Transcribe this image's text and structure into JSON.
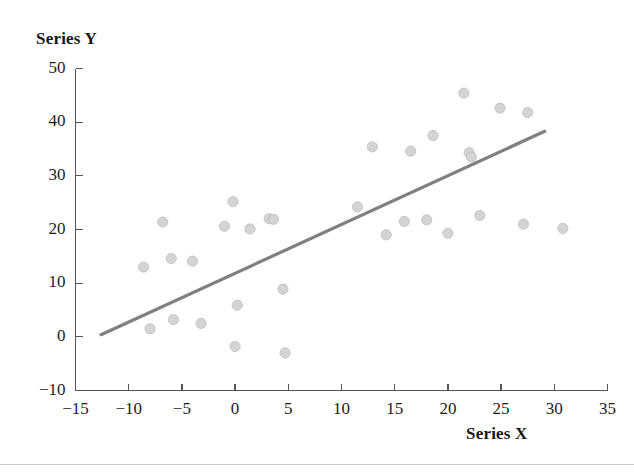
{
  "chart_data": {
    "type": "scatter",
    "title": "",
    "xlabel": "Series X",
    "ylabel": "Series Y",
    "xlim": [
      -15,
      35
    ],
    "ylim": [
      -10,
      50
    ],
    "xticks": [
      -15,
      -10,
      -5,
      0,
      5,
      10,
      15,
      20,
      25,
      30,
      35
    ],
    "yticks": [
      -10,
      0,
      10,
      20,
      30,
      40,
      50
    ],
    "grid": false,
    "legend": null,
    "marker_color": "#d4d4d4",
    "marker_edge_color": "#bdbdbd",
    "trendline_color": "#808080",
    "axis_color": "#555555",
    "series": [
      {
        "name": "Series Y",
        "marker": "circle",
        "points": [
          {
            "x": -8.6,
            "y": 13.0
          },
          {
            "x": -8.0,
            "y": 1.5
          },
          {
            "x": -6.8,
            "y": 21.4
          },
          {
            "x": -6.0,
            "y": 14.6
          },
          {
            "x": -5.8,
            "y": 3.2
          },
          {
            "x": -4.0,
            "y": 14.1
          },
          {
            "x": -3.2,
            "y": 2.5
          },
          {
            "x": -1.0,
            "y": 20.6
          },
          {
            "x": -0.2,
            "y": 25.2
          },
          {
            "x": 0.0,
            "y": -1.8
          },
          {
            "x": 0.2,
            "y": 5.9
          },
          {
            "x": 1.4,
            "y": 20.1
          },
          {
            "x": 3.2,
            "y": 22.0
          },
          {
            "x": 3.6,
            "y": 21.9
          },
          {
            "x": 4.5,
            "y": 8.9
          },
          {
            "x": 4.7,
            "y": -3.0
          },
          {
            "x": 11.5,
            "y": 24.2
          },
          {
            "x": 12.9,
            "y": 35.4
          },
          {
            "x": 14.2,
            "y": 19.0
          },
          {
            "x": 15.9,
            "y": 21.5
          },
          {
            "x": 16.5,
            "y": 34.6
          },
          {
            "x": 18.0,
            "y": 21.8
          },
          {
            "x": 18.6,
            "y": 37.5
          },
          {
            "x": 20.0,
            "y": 19.3
          },
          {
            "x": 21.5,
            "y": 45.4
          },
          {
            "x": 22.0,
            "y": 34.3
          },
          {
            "x": 22.2,
            "y": 33.5
          },
          {
            "x": 23.0,
            "y": 22.6
          },
          {
            "x": 24.9,
            "y": 42.6
          },
          {
            "x": 27.5,
            "y": 41.8
          },
          {
            "x": 27.1,
            "y": 21.0
          },
          {
            "x": 30.8,
            "y": 20.2
          }
        ]
      }
    ],
    "trendline": {
      "name": "linear-fit",
      "x_start": -12.6,
      "y_start": 0.4,
      "x_end": 29.1,
      "y_end": 38.3
    }
  }
}
